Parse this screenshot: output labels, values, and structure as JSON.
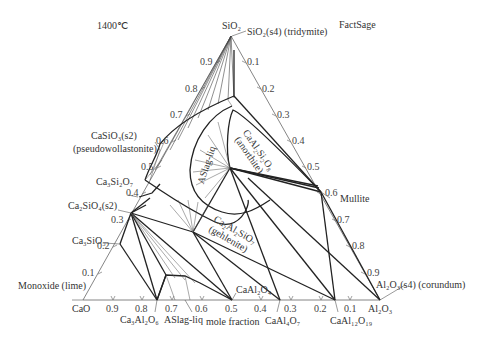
{
  "header": {
    "temperature": "1400℃",
    "software": "FactSage"
  },
  "vertices": {
    "top": "SiO₂",
    "left": "CaO",
    "right": "Al₂O₃"
  },
  "axis_label": "mole fraction",
  "left_ticks": [
    "0.9",
    "0.8",
    "0.7",
    "0.6",
    "0.5",
    "0.4",
    "0.3",
    "0.2",
    "0.1"
  ],
  "right_ticks": [
    "0.1",
    "0.2",
    "0.3",
    "0.4",
    "0.5",
    "0.6",
    "0.7",
    "0.8",
    "0.9"
  ],
  "bottom_ticks": [
    "0.9",
    "0.8",
    "0.7",
    "0.6",
    "0.5",
    "0.4",
    "0.3",
    "0.2",
    "0.1"
  ],
  "phase_labels": {
    "tridymite": "SiO₂(s4) (tridymite)",
    "pseudowollastonite_1": "CaSiO₃(s2)",
    "pseudowollastonite_2": "(pseudowollastonite)",
    "rankinite": "Ca₃Si₂O₇",
    "c2s": "Ca₂SiO₄(s2)",
    "c3s": "Ca₃SiO₅",
    "lime": "Monoxide (lime)",
    "c3a": "Ca₃Al₂O₆",
    "aslag_bottom": "ASlag-liq",
    "ca": "CaAl₂O₄",
    "ca2": "CaAl₄O₇",
    "ca6": "CaAl₁₂O₁₉",
    "corundum": "Al₂O₃(s4) (corundum)",
    "mullite": "Mullite",
    "aslag_center": "ASlag-liq",
    "anorthite_1": "CaAl₂Si₂O₈",
    "anorthite_2": "(anorthite)",
    "gehlenite_1": "Ca₂Al₂SiO₇",
    "gehlenite_2": "(gehlenite)"
  },
  "colors": {
    "line": "#222222",
    "thin": "#555555",
    "text": "#333333"
  }
}
